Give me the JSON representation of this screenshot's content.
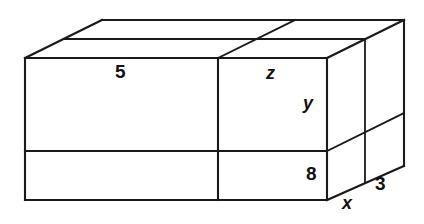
{
  "figure": {
    "kind": "3d-rectangular-box-diagram",
    "stroke_color": "#1a1a1a",
    "fill_color": "#ffffff",
    "background_color": "#ffffff",
    "labels": [
      {
        "id": "top-length",
        "text": "5",
        "kind": "number"
      },
      {
        "id": "top-depth",
        "text": "z",
        "kind": "variable"
      },
      {
        "id": "upper-height",
        "text": "y",
        "kind": "variable"
      },
      {
        "id": "lower-height",
        "text": "8",
        "kind": "number"
      },
      {
        "id": "front-depth",
        "text": "x",
        "kind": "variable"
      },
      {
        "id": "side-depth",
        "text": "3",
        "kind": "number"
      }
    ]
  },
  "geometry": {
    "front_left_x": 25,
    "front_right_x": 327,
    "front_top_y": 58,
    "front_bottom_y": 200,
    "vertical_divider_x": 218,
    "horizontal_divider_y": 151,
    "back_right_x": 404,
    "back_top_y": 20,
    "back_bottom_y": 166,
    "side_divider_x": 365,
    "depth_dx": 77,
    "depth_dy": -38
  }
}
